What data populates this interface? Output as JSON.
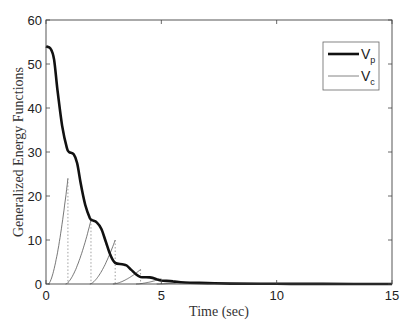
{
  "chart_data": {
    "type": "line",
    "title": "",
    "xlabel": "Time (sec)",
    "ylabel": "Generalized Energy Functions",
    "xlim": [
      0,
      15
    ],
    "ylim": [
      0,
      60
    ],
    "xticks": [
      0,
      5,
      10,
      15
    ],
    "yticks": [
      0,
      10,
      20,
      30,
      40,
      50,
      60
    ],
    "grid": false,
    "legend": {
      "position": "upper right",
      "entries": [
        {
          "label": "V",
          "sub": "p",
          "style": "thick solid black"
        },
        {
          "label": "V",
          "sub": "c",
          "style": "thin solid gray"
        }
      ]
    },
    "series": [
      {
        "name": "Vp",
        "x": [
          0,
          0.2,
          0.35,
          0.5,
          0.7,
          0.9,
          1.0,
          1.2,
          1.35,
          1.5,
          1.7,
          1.9,
          2.0,
          2.2,
          2.4,
          2.6,
          2.8,
          3.0,
          3.3,
          3.5,
          3.7,
          3.9,
          4.1,
          4.5,
          4.8,
          5.0,
          5.5,
          6.0,
          7.0,
          8.0,
          10.0,
          12.0,
          15.0
        ],
        "values": [
          54,
          53.5,
          51,
          44,
          36,
          31,
          30,
          29.5,
          27.5,
          23,
          18,
          15,
          14.5,
          14,
          12.5,
          9.5,
          6.5,
          4.8,
          4.5,
          4.2,
          3.2,
          2.2,
          1.6,
          1.5,
          1.1,
          0.8,
          0.6,
          0.35,
          0.2,
          0.1,
          0.05,
          0.02,
          0.0
        ]
      },
      {
        "name": "Vc",
        "pulses": [
          {
            "start": 0.1,
            "peak_t": 0.95,
            "peak": 24
          },
          {
            "start": 0.85,
            "peak_t": 1.95,
            "peak": 14.5
          },
          {
            "start": 1.9,
            "peak_t": 3.0,
            "peak": 10
          },
          {
            "start": 2.9,
            "peak_t": 4.1,
            "peak": 3.3
          },
          {
            "start": 3.9,
            "peak_t": 5.0,
            "peak": 1.2
          },
          {
            "start": 4.8,
            "peak_t": 6.0,
            "peak": 0.4
          }
        ],
        "reset_markers_dotted": [
          0.95,
          1.95,
          3.0,
          4.1
        ]
      }
    ]
  }
}
